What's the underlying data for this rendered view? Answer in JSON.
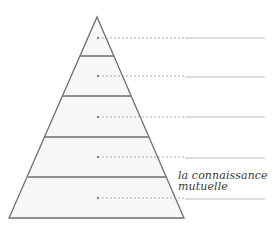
{
  "diagram": {
    "type": "pyramid",
    "levels": 5,
    "colors": {
      "outline": "#6e6e6e",
      "fill": "#f7f7f7",
      "dash": "#9a9a9a",
      "line": "#b5b5b5",
      "text": "#3a3a3a"
    },
    "level_labels": [
      {
        "level": 1,
        "text": ""
      },
      {
        "level": 2,
        "text": ""
      },
      {
        "level": 3,
        "text": ""
      },
      {
        "level": 4,
        "text": ""
      },
      {
        "level": 5,
        "text": "la connaissance mutuelle"
      }
    ],
    "bottom_label_line1": "la connaissance",
    "bottom_label_line2": "mutuelle"
  }
}
